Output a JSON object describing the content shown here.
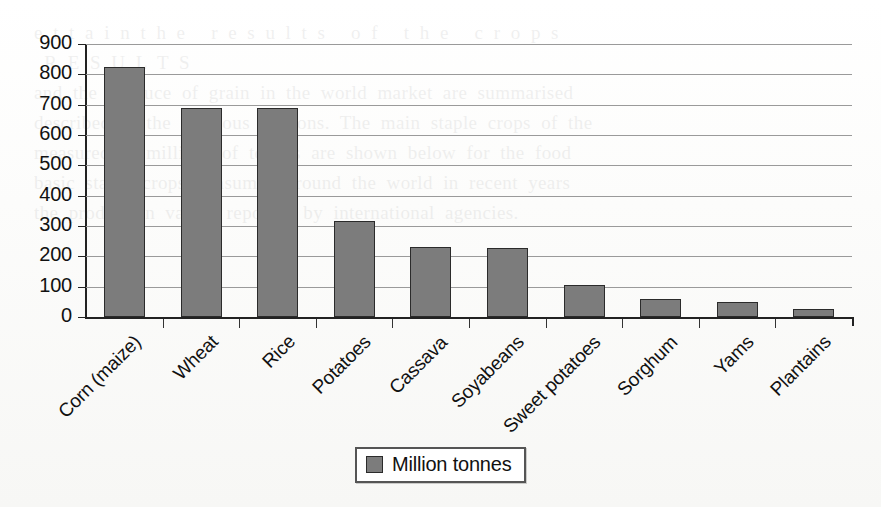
{
  "chart_data": {
    "type": "bar",
    "title": "",
    "xlabel": "",
    "ylabel": "",
    "ylim": [
      0,
      900
    ],
    "ytick_step": 100,
    "yticks": [
      "900",
      "800",
      "700",
      "600",
      "500",
      "400",
      "300",
      "200",
      "100",
      "0"
    ],
    "grid": true,
    "legend_position": "bottom-center",
    "categories": [
      "Corn (maize)",
      "Wheat",
      "Rice",
      "Potatoes",
      "Cassava",
      "Soyabeans",
      "Sweet potatoes",
      "Sorghum",
      "Yams",
      "Plantains"
    ],
    "series": [
      {
        "name": "Million tonnes",
        "color": "#7c7c7c",
        "values": [
          825,
          690,
          688,
          315,
          232,
          227,
          105,
          60,
          48,
          28
        ]
      }
    ]
  },
  "legend": {
    "entries": [
      {
        "label": "Million tonnes",
        "color": "#7c7c7c"
      }
    ]
  },
  "background": {
    "ghost_text": "e  t  t  a  i  n  t  h  e     r  e  s  u  l  t  s     o  f     t  h  e     c  r  o  p  s\n  R  E  S  U  L  T  S\nand  the  produce  of  grain  in  the  world  market  are  summarised\ndescribed  in  the  previous  sections.  The  main  staple  crops  of  the\nmeasured  in  millions  of  tonnes  are  shown  below  for  the  food\nbasic  staple  crops  consumed  around  the  world  in  recent  years\nthe  production  values  reported  by  international  agencies."
  }
}
